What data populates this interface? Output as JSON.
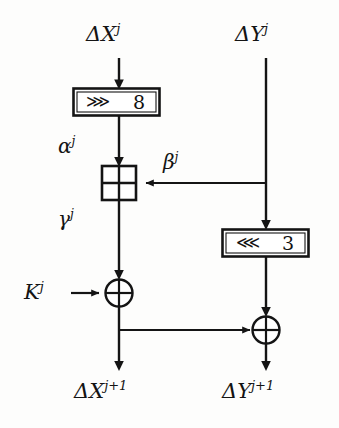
{
  "diagram": {
    "type": "block-cipher-round-schematic",
    "stroke_color": "#141414",
    "background_color": "#fdfdfc",
    "inputs": [
      {
        "id": "delta-x-j",
        "base": "ΔX",
        "exponent": "j",
        "text": "ΔXⱼ",
        "position": "top-left"
      },
      {
        "id": "delta-y-j",
        "base": "ΔY",
        "exponent": "j",
        "text": "ΔYⱼ",
        "position": "top-right"
      }
    ],
    "outputs": [
      {
        "id": "delta-x-j-plus-1",
        "base": "ΔX",
        "exponent": "j+1",
        "text": "ΔXⱼ⁺¹",
        "position": "bottom-left"
      },
      {
        "id": "delta-y-j-plus-1",
        "base": "ΔY",
        "exponent": "j+1",
        "text": "ΔYⱼ⁺¹",
        "position": "bottom-right"
      }
    ],
    "operations": [
      {
        "id": "rotate-right-8",
        "kind": "rotation",
        "direction": "right",
        "glyph": "⋙",
        "amount": "8",
        "label": "⋙ 8",
        "branch": "left"
      },
      {
        "id": "modular-addition",
        "kind": "modular-add",
        "glyph": "⊞",
        "label": "⊞",
        "branch": "left"
      },
      {
        "id": "rotate-left-3",
        "kind": "rotation",
        "direction": "left",
        "glyph": "⋘",
        "amount": "3",
        "label": "⋘ 3",
        "branch": "right"
      },
      {
        "id": "xor-key",
        "kind": "xor",
        "glyph": "⊕",
        "label": "⊕",
        "branch": "left"
      },
      {
        "id": "xor-output",
        "kind": "xor",
        "glyph": "⊕",
        "label": "⊕",
        "branch": "right"
      }
    ],
    "intermediate_labels": [
      {
        "id": "alpha-j",
        "base": "α",
        "exponent": "j",
        "text": "αⱼ",
        "on_wire": "left-after-rotation"
      },
      {
        "id": "beta-j",
        "base": "β",
        "exponent": "j",
        "text": "βⱼ",
        "on_wire": "right-to-addition"
      },
      {
        "id": "gamma-j",
        "base": "γ",
        "exponent": "j",
        "text": "γⱼ",
        "on_wire": "left-after-addition"
      }
    ],
    "key_input": {
      "id": "key-j",
      "base": "K",
      "exponent": "j",
      "text": "Kⱼ"
    }
  }
}
